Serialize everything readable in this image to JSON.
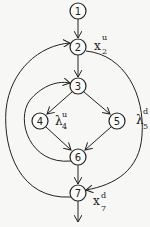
{
  "diagram": {
    "type": "control-flow-graph",
    "nodes": [
      {
        "id": "1",
        "label": "1",
        "x": 78,
        "y": 11
      },
      {
        "id": "2",
        "label": "2",
        "x": 78,
        "y": 47
      },
      {
        "id": "3",
        "label": "3",
        "x": 78,
        "y": 86
      },
      {
        "id": "4",
        "label": "4",
        "x": 40,
        "y": 121
      },
      {
        "id": "5",
        "label": "5",
        "x": 117,
        "y": 121
      },
      {
        "id": "6",
        "label": "6",
        "x": 78,
        "y": 157
      },
      {
        "id": "7",
        "label": "7",
        "x": 78,
        "y": 193
      }
    ],
    "edges": [
      {
        "from": "1",
        "to": "2"
      },
      {
        "from": "2",
        "to": "3"
      },
      {
        "from": "3",
        "to": "4"
      },
      {
        "from": "3",
        "to": "5"
      },
      {
        "from": "4",
        "to": "6"
      },
      {
        "from": "5",
        "to": "6"
      },
      {
        "from": "6",
        "to": "7"
      },
      {
        "from": "6",
        "to": "3",
        "kind": "back-edge"
      },
      {
        "from": "7",
        "to": "2",
        "kind": "back-edge"
      },
      {
        "from": "2",
        "to": "7",
        "kind": "forward-edge"
      },
      {
        "from": "7",
        "to": "exit"
      }
    ],
    "annotations": [
      {
        "id": "x2u",
        "base": "x",
        "sup": "u",
        "sub": "2",
        "near": "2"
      },
      {
        "id": "x4u",
        "base": "λ",
        "sup": "u",
        "sub": "4",
        "near": "4"
      },
      {
        "id": "x5d",
        "base": "λ",
        "sup": "d",
        "sub": "5",
        "near": "5"
      },
      {
        "id": "x7d",
        "base": "x",
        "sup": "d",
        "sub": "7",
        "near": "7"
      }
    ]
  }
}
